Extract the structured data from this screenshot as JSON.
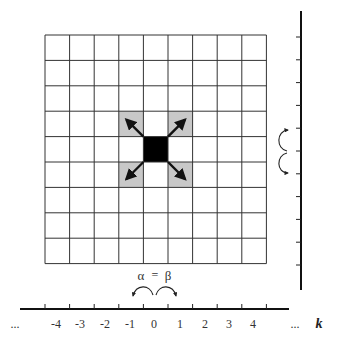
{
  "figure": {
    "grid": {
      "columns": 9,
      "rows": 9,
      "origin_px": [
        45,
        35
      ],
      "cell_w": 24.6,
      "cell_h": 25.4,
      "line_color": "#333333"
    },
    "center_cell": {
      "col": 4,
      "row": 4,
      "color": "#000000"
    },
    "shaded_cells": [
      {
        "col": 3,
        "row": 3
      },
      {
        "col": 5,
        "row": 3
      },
      {
        "col": 3,
        "row": 5
      },
      {
        "col": 5,
        "row": 5
      }
    ],
    "shade_color": "#c8c8c8",
    "arrows": [
      "up-left",
      "up-right",
      "down-left",
      "down-right"
    ],
    "horizontal_axis": {
      "tick_labels": [
        "...",
        "-4",
        "-3",
        "-2",
        "-1",
        "0",
        "1",
        "2",
        "3",
        "4",
        "..."
      ],
      "axis_label": "k",
      "hop_labels": {
        "left": "α",
        "equals": "=",
        "right": "β"
      }
    },
    "vertical_axis": {
      "tick_count": 11,
      "hop_arrows": [
        "up",
        "down"
      ]
    }
  }
}
